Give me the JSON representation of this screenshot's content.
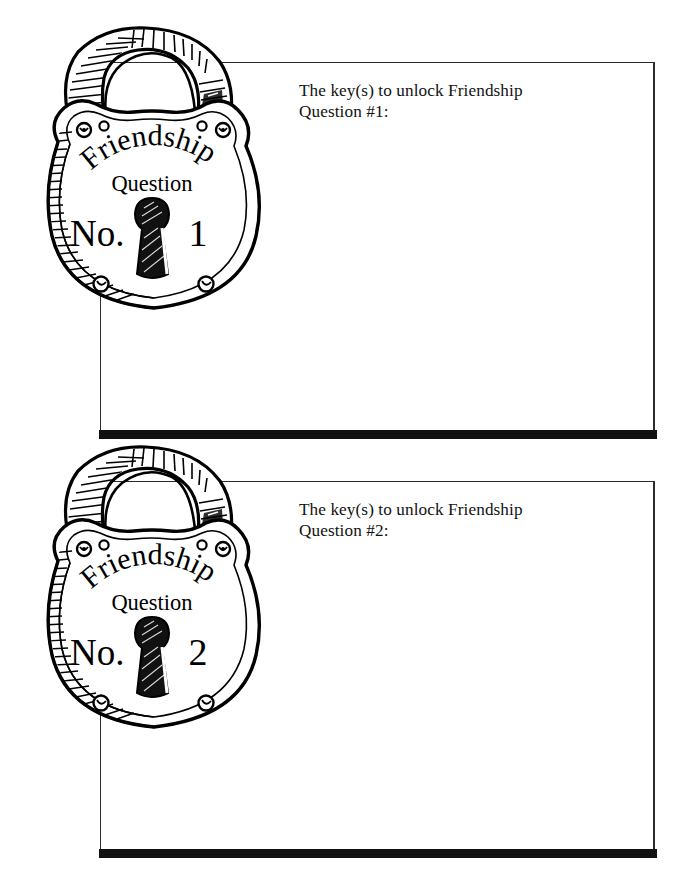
{
  "page": {
    "background_color": "#ffffff",
    "ink_color": "#111111"
  },
  "locks": [
    {
      "brand_arc": "Friendship",
      "subtitle": "Question",
      "number_prefix": "No.",
      "number": "1",
      "icon": "padlock-illustration"
    },
    {
      "brand_arc": "Friendship",
      "subtitle": "Question",
      "number_prefix": "No.",
      "number": "2",
      "icon": "padlock-illustration"
    }
  ],
  "blocks": [
    {
      "prompt": "The key(s) to unlock Friendship\nQuestion #1:",
      "answer": ""
    },
    {
      "prompt": "The key(s) to unlock Friendship\nQuestion #2:",
      "answer": ""
    }
  ]
}
